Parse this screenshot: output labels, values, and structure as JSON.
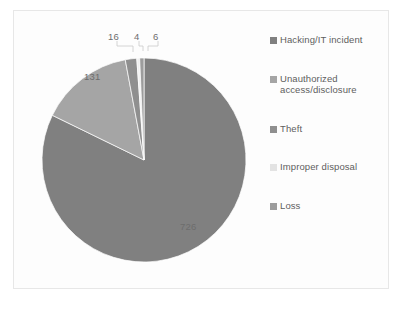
{
  "chart_data": {
    "type": "pie",
    "title": "",
    "subtitle": "",
    "xlabel": "",
    "ylabel": "",
    "legend_position": "right",
    "grid": false,
    "total": 883,
    "categories": [
      "Hacking/IT incident",
      "Unauthorized access/disclosure",
      "Theft",
      "Improper disposal",
      "Loss"
    ],
    "values": [
      726,
      131,
      16,
      4,
      6
    ],
    "data_labels": [
      "726",
      "131",
      "16",
      "4",
      "6"
    ],
    "colors": [
      "#808080",
      "#a5a5a5",
      "#8f8f8f",
      "#f0f0f0",
      "#9c9c9c"
    ],
    "slices": [
      {
        "name": "Hacking/IT incident",
        "value": 726,
        "label": "726",
        "color": "#808080"
      },
      {
        "name": "Unauthorized access/disclosure",
        "value": 131,
        "label": "131",
        "color": "#a5a5a5"
      },
      {
        "name": "Theft",
        "value": 16,
        "label": "16",
        "color": "#8f8f8f"
      },
      {
        "name": "Improper disposal",
        "value": 4,
        "label": "4",
        "color": "#f0f0f0"
      },
      {
        "name": "Loss",
        "value": 6,
        "label": "6",
        "color": "#9c9c9c"
      }
    ]
  },
  "legend": {
    "items": [
      {
        "label": "Hacking/IT incident",
        "color": "#808080"
      },
      {
        "label": "Unauthorized access/disclosure",
        "color": "#a5a5a5"
      },
      {
        "label": "Theft",
        "color": "#8f8f8f"
      },
      {
        "label": "Improper disposal",
        "color": "#e3e3e3"
      },
      {
        "label": "Loss",
        "color": "#9c9c9c"
      }
    ]
  },
  "labels": {
    "hacking": "726",
    "unauthorized": "131",
    "theft": "16",
    "disposal": "4",
    "loss": "6"
  }
}
